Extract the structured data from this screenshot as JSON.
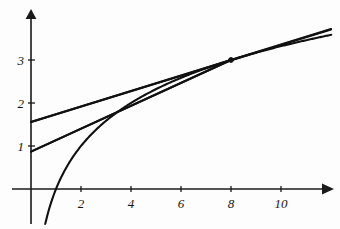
{
  "chart_data": {
    "type": "line",
    "title": "",
    "subtitle": "",
    "xlabel": "",
    "ylabel": "",
    "xlim": [
      -0.3,
      12.1
    ],
    "ylim": [
      -1.1,
      4.1
    ],
    "grid": false,
    "legend": "none",
    "x_ticks": [
      2,
      4,
      6,
      8,
      10
    ],
    "x_tick_labels": [
      "2",
      "4",
      "6",
      "8",
      "10"
    ],
    "y_ticks": [
      1,
      2,
      3
    ],
    "y_tick_labels": [
      "1",
      "2",
      "3"
    ],
    "axes": {
      "x_axis_arrow": true,
      "y_axis_arrow": true,
      "origin_x": 0,
      "origin_y": 0
    },
    "series": [
      {
        "name": "log curve",
        "type": "curve",
        "expression": "y = log2(x)",
        "x": [
          0.55,
          0.7,
          0.85,
          1.0,
          1.25,
          1.5,
          1.75,
          2.0,
          2.5,
          3.0,
          3.5,
          4.0,
          4.5,
          5.0,
          5.5,
          6.0,
          6.5,
          7.0,
          7.5,
          8.0,
          8.5,
          9.0,
          9.5,
          10.0,
          10.5,
          11.0,
          11.5,
          12.0
        ],
        "y": [
          -0.862,
          -0.515,
          -0.234,
          0.0,
          0.322,
          0.585,
          0.807,
          1.0,
          1.322,
          1.585,
          1.807,
          2.0,
          2.17,
          2.322,
          2.459,
          2.585,
          2.7,
          2.807,
          2.907,
          3.0,
          3.087,
          3.17,
          3.248,
          3.322,
          3.392,
          3.459,
          3.524,
          3.585
        ]
      },
      {
        "name": "tangent line at x = 8",
        "type": "line",
        "expression": "y = 1.557 + 0.1803 x",
        "x": [
          0,
          12
        ],
        "y": [
          1.557,
          3.72
        ]
      },
      {
        "name": "secant line through (1,0) and (8,3)",
        "type": "line",
        "expression": "y = 0.87 + 0.2664 x",
        "x": [
          0,
          8
        ],
        "y": [
          0.87,
          3.0
        ]
      }
    ],
    "annotations": [
      {
        "name": "tangent-point",
        "x": 8,
        "y": 3,
        "marker": "dot",
        "label": ""
      }
    ],
    "colors": {
      "curve": "#111111",
      "axis": "#1a1a1a",
      "background": "#fdfdfd",
      "tick_label": "#141414"
    }
  }
}
